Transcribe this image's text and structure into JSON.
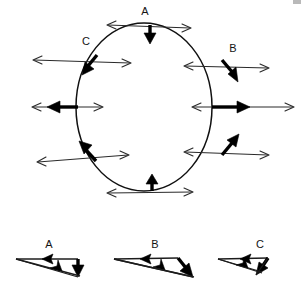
{
  "figure": {
    "title": "",
    "background_color": "#ffffff",
    "stroke_color": "#000000",
    "thin_stroke_color": "#2a2a2a"
  },
  "circle_diagram": {
    "name": "circular-motion-diagram",
    "center": {
      "x": 144,
      "y": 107
    },
    "radius_x": 68,
    "radius_y": 84,
    "labels": [
      {
        "id": "label-A",
        "text": "A",
        "x": 150,
        "y": 14
      },
      {
        "id": "label-B",
        "text": "B",
        "x": 233,
        "y": 52
      },
      {
        "id": "label-C",
        "text": "C",
        "x": 86,
        "y": 45
      }
    ],
    "vector_points": [
      {
        "id": "point-A",
        "label": "A",
        "position_deg": 90,
        "thick_vector": {
          "direction": "down",
          "description": "centripetal acceleration pointing to center"
        },
        "thin_vector": {
          "direction": "horizontal-both",
          "description": "velocity tangent, double headed"
        }
      },
      {
        "id": "point-B",
        "label": "B",
        "position_deg": 45,
        "thick_vector": {
          "direction": "down-right",
          "description": "acceleration"
        },
        "thin_vector": {
          "direction": "horizontal-both",
          "description": "tangential double headed"
        }
      },
      {
        "id": "point-C",
        "label": "C",
        "position_deg": 135,
        "thick_vector": {
          "direction": "down-left",
          "description": "acceleration"
        },
        "thin_vector": {
          "direction": "horizontal-both",
          "description": "tangential double headed"
        }
      },
      {
        "id": "point-left",
        "label": "",
        "position_deg": 180,
        "thick_vector": {
          "direction": "left",
          "description": "acceleration"
        },
        "thin_vector": {
          "direction": "horizontal-both",
          "description": "tangential double headed"
        }
      },
      {
        "id": "point-right",
        "label": "",
        "position_deg": 0,
        "thick_vector": {
          "direction": "right",
          "description": "acceleration"
        },
        "thin_vector": {
          "direction": "horizontal-both",
          "description": "tangential double headed"
        }
      },
      {
        "id": "point-bottom-left",
        "label": "",
        "position_deg": 225,
        "thick_vector": {
          "direction": "up-left",
          "description": "acceleration"
        },
        "thin_vector": {
          "direction": "horizontal-both",
          "description": "tangential double headed"
        }
      },
      {
        "id": "point-bottom-right",
        "label": "",
        "position_deg": 315,
        "thick_vector": {
          "direction": "up-right",
          "description": "acceleration"
        },
        "thin_vector": {
          "direction": "horizontal-both",
          "description": "tangential double headed"
        }
      },
      {
        "id": "point-bottom",
        "label": "",
        "position_deg": 270,
        "thick_vector": {
          "direction": "up",
          "description": "centripetal acceleration pointing to center"
        },
        "thin_vector": {
          "direction": "horizontal-both",
          "description": "velocity tangent, double headed"
        }
      }
    ]
  },
  "vector_triangles": [
    {
      "id": "triangle-A",
      "label": "A",
      "label_x": 47,
      "label_y": 245,
      "origin_x": 16,
      "origin_y": 259,
      "top_arrow": {
        "direction": "left",
        "length": 62,
        "description": "horizontal component arrow pointing left"
      },
      "side_arrow": {
        "direction": "down",
        "length": 22,
        "description": "thick vertical arrow pointing down"
      },
      "resultant_arrow": {
        "direction": "down-right",
        "description": "thin resultant arrow"
      }
    },
    {
      "id": "triangle-B",
      "label": "B",
      "label_x": 153,
      "label_y": 245,
      "origin_x": 114,
      "origin_y": 259,
      "top_arrow": {
        "direction": "left",
        "length": 62,
        "description": "horizontal component arrow pointing left"
      },
      "side_arrow": {
        "direction": "down-right",
        "length": 28,
        "description": "thick diagonal arrow pointing down-right"
      },
      "resultant_arrow": {
        "direction": "down-right",
        "description": "thin resultant arrow"
      }
    },
    {
      "id": "triangle-C",
      "label": "C",
      "label_x": 260,
      "label_y": 245,
      "origin_x": 218,
      "origin_y": 259,
      "top_arrow": {
        "direction": "left",
        "length": 50,
        "description": "horizontal component arrow pointing left"
      },
      "side_arrow": {
        "direction": "down-left",
        "length": 22,
        "description": "thick diagonal arrow pointing down-left"
      },
      "resultant_arrow": {
        "direction": "down-right",
        "description": "thin resultant arrow"
      }
    }
  ]
}
